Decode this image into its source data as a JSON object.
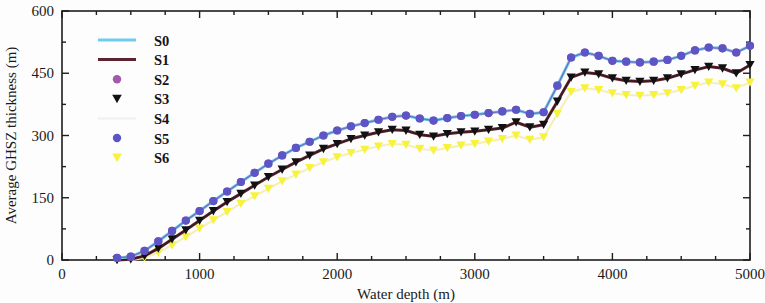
{
  "chart_data": {
    "type": "line",
    "title": "",
    "xlabel": "Water depth (m)",
    "ylabel": "Average GHSZ thickness (m)",
    "xlim": [
      0,
      5000
    ],
    "ylim": [
      0,
      600
    ],
    "xticks": [
      0,
      1000,
      2000,
      3000,
      4000,
      5000
    ],
    "yticks": [
      0,
      150,
      300,
      450,
      600
    ],
    "xtick_labels": [
      "0",
      "1000",
      "2000",
      "3000",
      "4000",
      "5000"
    ],
    "ytick_labels": [
      "0",
      "150",
      "300",
      "450",
      "600"
    ],
    "x_minor_interval": 250,
    "y_minor_interval": 75,
    "grid": false,
    "legend_position": "upper-left",
    "x": [
      400,
      500,
      600,
      700,
      800,
      900,
      1000,
      1100,
      1200,
      1300,
      1400,
      1500,
      1600,
      1700,
      1800,
      1900,
      2000,
      2100,
      2200,
      2300,
      2400,
      2500,
      2600,
      2700,
      2800,
      2900,
      3000,
      3100,
      3200,
      3300,
      3400,
      3500,
      3600,
      3700,
      3800,
      3900,
      4000,
      4100,
      4200,
      4300,
      4400,
      4500,
      4600,
      4700,
      4800,
      4900,
      5000
    ],
    "series": [
      {
        "name": "S0",
        "color": "#6FCDEA",
        "style": "line",
        "marker": "none",
        "linewidth": 3,
        "values": [
          5,
          8,
          22,
          45,
          70,
          95,
          118,
          142,
          165,
          188,
          210,
          232,
          252,
          270,
          285,
          300,
          312,
          322,
          330,
          338,
          345,
          348,
          341,
          336,
          342,
          347,
          350,
          354,
          358,
          362,
          352,
          356,
          420,
          488,
          500,
          492,
          480,
          478,
          476,
          478,
          482,
          492,
          505,
          512,
          510,
          500,
          516
        ]
      },
      {
        "name": "S1",
        "color": "#5B2430",
        "style": "line",
        "marker": "none",
        "linewidth": 3,
        "values": [
          0,
          2,
          10,
          28,
          50,
          72,
          95,
          118,
          140,
          160,
          180,
          200,
          218,
          236,
          252,
          268,
          280,
          292,
          300,
          308,
          314,
          312,
          302,
          298,
          304,
          308,
          310,
          314,
          318,
          332,
          320,
          326,
          382,
          440,
          452,
          448,
          438,
          432,
          430,
          432,
          438,
          448,
          458,
          466,
          462,
          450,
          470
        ]
      },
      {
        "name": "S2",
        "color": "#A25AAA",
        "style": "marker",
        "marker": "circle",
        "linewidth": 0,
        "values": [
          5,
          8,
          22,
          45,
          70,
          95,
          118,
          142,
          165,
          188,
          210,
          232,
          252,
          270,
          285,
          300,
          312,
          322,
          330,
          338,
          345,
          348,
          341,
          336,
          342,
          347,
          350,
          354,
          358,
          362,
          352,
          356,
          420,
          488,
          500,
          492,
          480,
          478,
          476,
          478,
          482,
          492,
          505,
          512,
          510,
          500,
          516
        ]
      },
      {
        "name": "S3",
        "color": "#111111",
        "style": "marker",
        "marker": "triangle-down",
        "linewidth": 0,
        "values": [
          0,
          2,
          10,
          28,
          50,
          72,
          95,
          118,
          140,
          160,
          180,
          200,
          218,
          236,
          252,
          268,
          280,
          292,
          300,
          308,
          314,
          312,
          302,
          298,
          304,
          308,
          310,
          314,
          318,
          332,
          320,
          326,
          382,
          440,
          452,
          448,
          438,
          432,
          430,
          432,
          438,
          448,
          458,
          466,
          462,
          450,
          470
        ]
      },
      {
        "name": "S4",
        "color": "#F4F1F4",
        "style": "line",
        "marker": "none",
        "linewidth": 2.5,
        "values": [
          0,
          0,
          6,
          18,
          36,
          56,
          76,
          96,
          116,
          136,
          154,
          172,
          190,
          206,
          222,
          236,
          248,
          258,
          266,
          274,
          280,
          278,
          268,
          264,
          270,
          276,
          280,
          286,
          292,
          300,
          290,
          296,
          352,
          405,
          414,
          410,
          402,
          398,
          396,
          398,
          402,
          410,
          420,
          428,
          424,
          414,
          428
        ]
      },
      {
        "name": "S5",
        "color": "#5B55C6",
        "style": "marker",
        "marker": "circle",
        "linewidth": 0,
        "values": [
          5,
          8,
          22,
          45,
          70,
          95,
          118,
          142,
          165,
          188,
          210,
          232,
          252,
          270,
          285,
          300,
          312,
          322,
          330,
          338,
          345,
          348,
          341,
          336,
          342,
          347,
          350,
          354,
          358,
          362,
          352,
          356,
          420,
          488,
          500,
          492,
          480,
          478,
          476,
          478,
          482,
          492,
          505,
          512,
          510,
          500,
          516
        ]
      },
      {
        "name": "S6",
        "color": "#F7F23C",
        "style": "marker",
        "marker": "triangle-down",
        "linewidth": 0,
        "values": [
          0,
          0,
          6,
          18,
          36,
          56,
          76,
          96,
          116,
          136,
          154,
          172,
          190,
          206,
          222,
          236,
          248,
          258,
          266,
          274,
          280,
          278,
          268,
          264,
          270,
          276,
          280,
          286,
          292,
          300,
          290,
          296,
          352,
          405,
          414,
          410,
          402,
          398,
          396,
          398,
          402,
          410,
          420,
          428,
          424,
          414,
          428
        ]
      }
    ]
  },
  "legend": {
    "entries": [
      {
        "label": "S0"
      },
      {
        "label": "S1"
      },
      {
        "label": "S2"
      },
      {
        "label": "S3"
      },
      {
        "label": "S4"
      },
      {
        "label": "S5"
      },
      {
        "label": "S6"
      }
    ]
  }
}
